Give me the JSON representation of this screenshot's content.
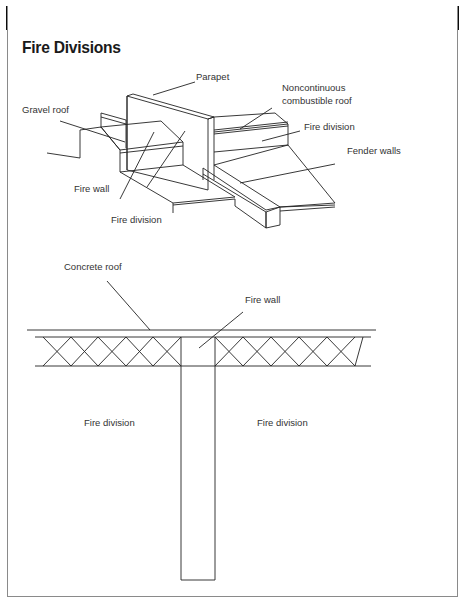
{
  "header": {
    "title": "Fire Divisions"
  },
  "isometric_view": {
    "labels": {
      "parapet": "Parapet",
      "gravel_roof": "Gravel roof",
      "noncontinuous_line1": "Noncontinuous",
      "noncontinuous_line2": "combustible roof",
      "fire_division_right": "Fire division",
      "fender_walls": "Fender walls",
      "fire_wall": "Fire wall",
      "fire_division_bottom": "Fire division"
    }
  },
  "section_view": {
    "labels": {
      "concrete_roof": "Concrete roof",
      "fire_wall": "Fire wall",
      "fire_division_left": "Fire division",
      "fire_division_right": "Fire division"
    }
  },
  "colors": {
    "header_bar": "#0b0b0b",
    "line": "#222222",
    "text": "#333333"
  }
}
